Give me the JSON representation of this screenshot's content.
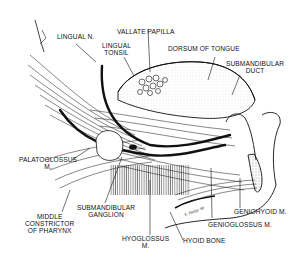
{
  "figure": {
    "signature": "E. Hodge '89"
  },
  "labels": {
    "lingual_n": "LINGUAL N.",
    "vallate_papilla": "VALLATE PAPILLA",
    "lingual_tonsil": "LINGUAL\nTONSIL",
    "dorsum_of_tongue": "DORSUM OF TONGUE",
    "submandibular_duct": "SUBMANDIBULAR\nDUCT",
    "palatoglossus": "PALATOGLOSSUS\nM.",
    "middle_constrictor": "MIDDLE\nCONSTRICTOR\nOF PHARYNX",
    "submandibular_ganglion": "SUBMANDIBULAR\nGANGLION",
    "hyoglossus": "HYOGLOSSUS\nM.",
    "hyoid_bone": "HYOID BONE",
    "genioglossus": "GENIOGLOSSUS M.",
    "geniohyoid": "GENIOHYOID M."
  },
  "colors": {
    "ink": "#111111",
    "background": "#ffffff"
  }
}
